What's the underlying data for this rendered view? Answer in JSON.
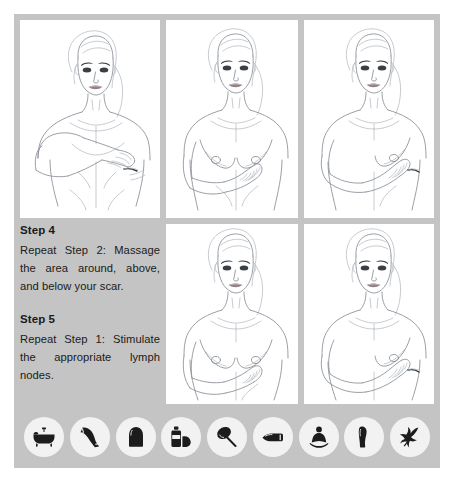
{
  "card": {
    "background_color": "#c4c4c4",
    "panel_color": "#ffffff",
    "page_background": "#ffffff"
  },
  "instructions": [
    {
      "heading": "Step 4",
      "body": "Repeat Step 2: Massage the area around, above, and below your scar."
    },
    {
      "heading": "Step 5",
      "body": "Repeat Step 1: Stimulate the appropriate lymph nodes."
    }
  ],
  "illustrations": [
    {
      "position": "top-left",
      "description": "Woman with flat post-mastectomy chest, hand laid flat across upper chest, surgical scar visible on right side"
    },
    {
      "position": "top-middle",
      "description": "Woman with breasts, fingers placed beneath the left breast"
    },
    {
      "position": "top-right",
      "description": "Woman with arm folded across torso, fingers at the side of the left breast"
    },
    {
      "position": "bottom-middle",
      "description": "Woman with breasts, hand resting low on the torso below the breast"
    },
    {
      "position": "bottom-right",
      "description": "Woman with arm across abdomen, fingers stimulating lymph node area"
    }
  ],
  "icon_strip": {
    "icons": [
      {
        "name": "bathtub-icon",
        "glyph": "bathtub"
      },
      {
        "name": "compression-sleeve-icon",
        "glyph": "arm-sleeve"
      },
      {
        "name": "compression-garment-icon",
        "glyph": "garment"
      },
      {
        "name": "lotion-bottle-icon",
        "glyph": "bottle"
      },
      {
        "name": "massage-brush-icon",
        "glyph": "brush"
      },
      {
        "name": "cream-tube-icon",
        "glyph": "tube"
      },
      {
        "name": "meditation-icon",
        "glyph": "meditating-figure"
      },
      {
        "name": "leg-wrap-icon",
        "glyph": "leg"
      },
      {
        "name": "herbal-plant-icon",
        "glyph": "plant-sprig"
      }
    ]
  }
}
